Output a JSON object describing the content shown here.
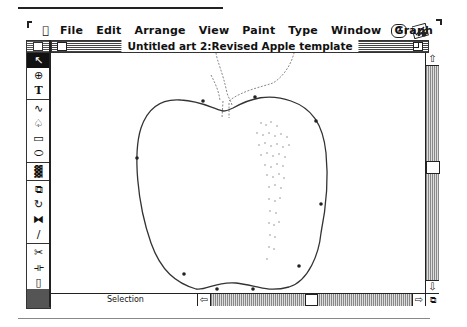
{
  "menubar": {
    "apple_icon": "",
    "items": [
      "File",
      "Edit",
      "Arrange",
      "View",
      "Paint",
      "Type",
      "Window",
      "Graph"
    ],
    "help_icon": "?",
    "app_icon": "application-icon"
  },
  "window": {
    "title": "Untitled art 2:Revised Apple template",
    "status_label": "Selection"
  },
  "palette": {
    "tools": [
      {
        "name": "selection-arrow",
        "glyph": "↖",
        "selected": true
      },
      {
        "name": "zoom",
        "glyph": "⊕"
      },
      {
        "name": "type",
        "glyph": "T"
      },
      {
        "name": "freehand",
        "glyph": "∿"
      },
      {
        "name": "pen",
        "glyph": "♤"
      },
      {
        "name": "rectangle",
        "glyph": "▭"
      },
      {
        "name": "oval",
        "glyph": "⬭"
      },
      {
        "name": "blend",
        "glyph": "▓"
      },
      {
        "name": "scale",
        "glyph": "⧉"
      },
      {
        "name": "rotate",
        "glyph": "↻"
      },
      {
        "name": "reflect",
        "glyph": "⧓"
      },
      {
        "name": "shear",
        "glyph": "∕"
      },
      {
        "name": "scissors",
        "glyph": "✂"
      },
      {
        "name": "measure",
        "glyph": "⟛"
      },
      {
        "name": "page",
        "glyph": "▯"
      },
      {
        "name": "graph",
        "glyph": "▁▃▅"
      }
    ]
  },
  "scroll": {
    "up": "⇧",
    "down": "⇩",
    "left": "⇦",
    "right": "⇨",
    "grow": "⧉"
  }
}
